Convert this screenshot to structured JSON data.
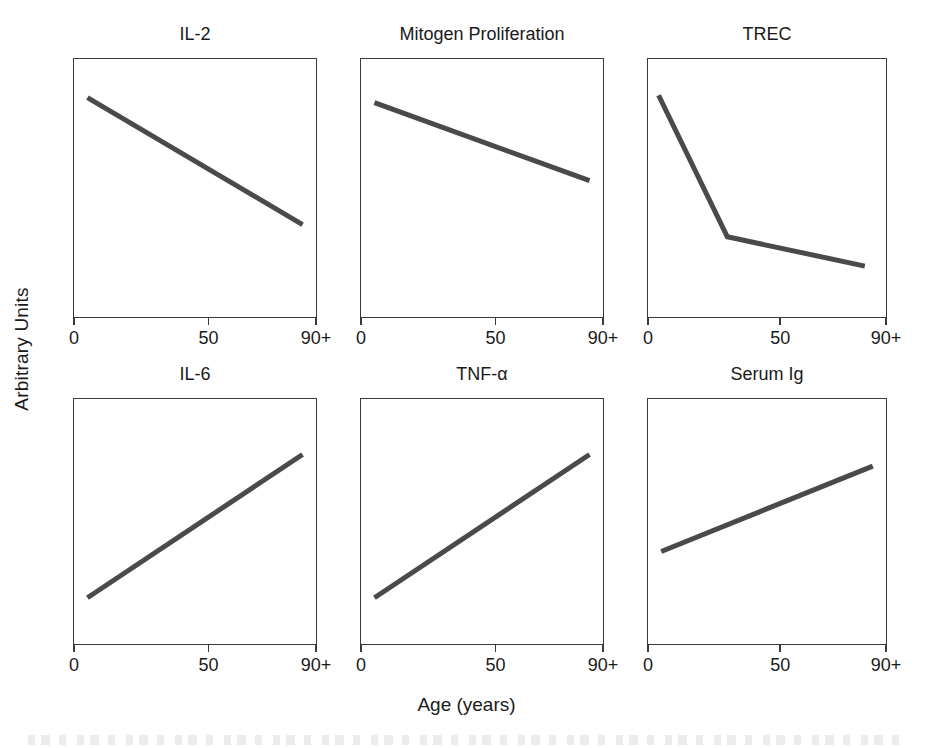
{
  "figure": {
    "ylabel": "Arbitrary Units",
    "xlabel": "Age (years)",
    "line_color": "#4a4a4a",
    "axis_color": "#3a3a3a",
    "background": "#ffffff"
  },
  "axis": {
    "ticks": [
      "0",
      "50",
      "90+"
    ],
    "tick_values": [
      0,
      50,
      90
    ]
  },
  "chart_data": [
    {
      "type": "line",
      "title": "IL-2",
      "xlabel": "Age (years)",
      "ylabel": "Arbitrary Units",
      "xlim": [
        0,
        90
      ],
      "ylim": [
        0,
        100
      ],
      "xticks": [
        0,
        50,
        90
      ],
      "xticklabels": [
        "0",
        "50",
        "90+"
      ],
      "grid": false,
      "legend": "none",
      "x": [
        5,
        85
      ],
      "values": [
        87,
        35
      ]
    },
    {
      "type": "line",
      "title": "Mitogen Proliferation",
      "xlabel": "Age (years)",
      "ylabel": "Arbitrary Units",
      "xlim": [
        0,
        90
      ],
      "ylim": [
        0,
        100
      ],
      "xticks": [
        0,
        50,
        90
      ],
      "xticklabels": [
        "0",
        "50",
        "90+"
      ],
      "grid": false,
      "legend": "none",
      "x": [
        5,
        85
      ],
      "values": [
        85,
        53
      ]
    },
    {
      "type": "line",
      "title": "TREC",
      "xlabel": "Age (years)",
      "ylabel": "Arbitrary Units",
      "xlim": [
        0,
        90
      ],
      "ylim": [
        0,
        100
      ],
      "xticks": [
        0,
        50,
        90
      ],
      "xticklabels": [
        "0",
        "50",
        "90+"
      ],
      "grid": false,
      "legend": "none",
      "x": [
        4,
        30,
        82
      ],
      "values": [
        88,
        30,
        18
      ]
    },
    {
      "type": "line",
      "title": "IL-6",
      "xlabel": "Age (years)",
      "ylabel": "Arbitrary Units",
      "xlim": [
        0,
        90
      ],
      "ylim": [
        0,
        100
      ],
      "xticks": [
        0,
        50,
        90
      ],
      "xticklabels": [
        "0",
        "50",
        "90+"
      ],
      "grid": false,
      "legend": "none",
      "x": [
        5,
        85
      ],
      "values": [
        17,
        79
      ]
    },
    {
      "type": "line",
      "title": "TNF-α",
      "xlabel": "Age (years)",
      "ylabel": "Arbitrary Units",
      "xlim": [
        0,
        90
      ],
      "ylim": [
        0,
        100
      ],
      "xticks": [
        0,
        50,
        90
      ],
      "xticklabels": [
        "0",
        "50",
        "90+"
      ],
      "grid": false,
      "legend": "none",
      "x": [
        5,
        85
      ],
      "values": [
        17,
        79
      ]
    },
    {
      "type": "line",
      "title": "Serum Ig",
      "xlabel": "Age (years)",
      "ylabel": "Arbitrary Units",
      "xlim": [
        0,
        90
      ],
      "ylim": [
        0,
        100
      ],
      "xticks": [
        0,
        50,
        90
      ],
      "xticklabels": [
        "0",
        "50",
        "90+"
      ],
      "grid": false,
      "legend": "none",
      "x": [
        5,
        85
      ],
      "values": [
        37,
        74
      ]
    }
  ]
}
